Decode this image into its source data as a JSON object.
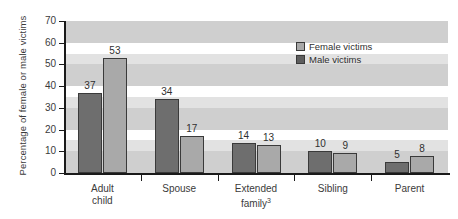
{
  "chart_data": {
    "type": "bar",
    "title": "",
    "xlabel": "",
    "ylabel": "Percentage of female or male victims",
    "ylim": [
      0,
      70
    ],
    "yticks": [
      0,
      10,
      20,
      30,
      40,
      50,
      60,
      70
    ],
    "grid": false,
    "background_bands": true,
    "legend_position": "top-right-inside",
    "categories": [
      "Adult child",
      "Spouse",
      "Extended family",
      "Sibling",
      "Parent"
    ],
    "category_labels": [
      "Adult\nchild",
      "Spouse",
      "Extended\nfamily³",
      "Sibling",
      "Parent"
    ],
    "category_footnotes": [
      "",
      "",
      "3",
      "",
      ""
    ],
    "series": [
      {
        "name": "Female victims",
        "color": "#6e6e6e",
        "values": [
          37,
          34,
          14,
          10,
          5
        ]
      },
      {
        "name": "Male victims",
        "color": "#a9a9a9",
        "values": [
          53,
          17,
          13,
          9,
          8
        ]
      }
    ]
  },
  "legend": {
    "items": [
      {
        "label": "Female victims",
        "swatch": "female"
      },
      {
        "label": "Male victims",
        "swatch": "male"
      }
    ]
  },
  "colors": {
    "female_bar": "#6e6e6e",
    "male_bar": "#a9a9a9",
    "band": "#cfcfcf",
    "axis": "#1a1a1a",
    "text": "#3b3b3b"
  }
}
